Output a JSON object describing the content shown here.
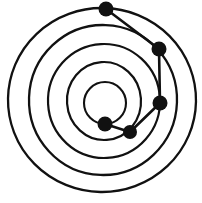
{
  "figure": {
    "type": "diagram",
    "width": 202,
    "height": 203,
    "background_color": "#ffffff",
    "stroke_color": "#111111",
    "node_color": "#111111"
  },
  "chart_data": {
    "type": "scatter",
    "title": "",
    "xlabel": "",
    "ylabel": "",
    "xlim": [
      0,
      202
    ],
    "ylim": [
      0,
      203
    ],
    "grid": false,
    "legend": "none",
    "rings": [
      {
        "label": "ring-1-innermost",
        "cx": 105,
        "cy": 103,
        "rx": 21,
        "ry": 21,
        "stroke_width": 2.1,
        "rotation": 0
      },
      {
        "label": "ring-2",
        "cx": 104,
        "cy": 101,
        "rx": 37,
        "ry": 39,
        "stroke_width": 2.2,
        "rotation": -4
      },
      {
        "label": "ring-3",
        "cx": 104,
        "cy": 101,
        "rx": 56,
        "ry": 57,
        "stroke_width": 2.2,
        "rotation": -3
      },
      {
        "label": "ring-4",
        "cx": 103,
        "cy": 100,
        "rx": 74,
        "ry": 75,
        "stroke_width": 2.3,
        "rotation": 2
      },
      {
        "label": "ring-5-outermost",
        "cx": 102,
        "cy": 100,
        "rx": 94,
        "ry": 92,
        "stroke_width": 2.3,
        "rotation": 1
      }
    ],
    "nodes": [
      {
        "label": "node-1",
        "x": 106,
        "y": 9,
        "r": 7.5,
        "ring": "ring-5-outermost"
      },
      {
        "label": "node-2",
        "x": 159,
        "y": 49,
        "r": 7.5,
        "ring": "ring-4"
      },
      {
        "label": "node-3",
        "x": 160,
        "y": 103,
        "r": 7.5,
        "ring": "ring-4"
      },
      {
        "label": "node-4",
        "x": 130,
        "y": 132,
        "r": 7.0,
        "ring": "ring-3"
      },
      {
        "label": "node-5",
        "x": 105,
        "y": 124,
        "r": 7.5,
        "ring": "ring-1-innermost"
      }
    ],
    "links": [
      {
        "label": "link-1-2",
        "from": "node-1",
        "to": "node-2",
        "stroke_width": 2.6
      },
      {
        "label": "link-2-3",
        "from": "node-2",
        "to": "node-3",
        "stroke_width": 2.6
      },
      {
        "label": "link-3-4",
        "from": "node-3",
        "to": "node-4",
        "stroke_width": 2.6
      },
      {
        "label": "link-4-5",
        "from": "node-4",
        "to": "node-5",
        "stroke_width": 2.6
      }
    ],
    "path_polyline": [
      [
        106,
        9
      ],
      [
        159,
        49
      ],
      [
        160,
        103
      ],
      [
        130,
        132
      ],
      [
        105,
        124
      ]
    ]
  }
}
